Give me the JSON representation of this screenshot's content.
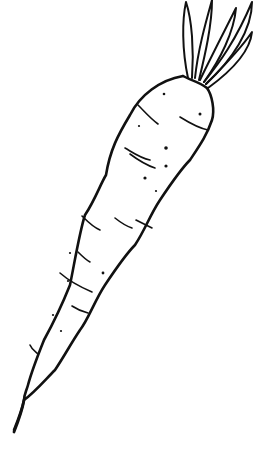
{
  "image": {
    "subject": "carrot line drawing",
    "alt": "Black-and-white outline sketch of a carrot with leafy top, drawn diagonally",
    "background_color": "#ffffff",
    "stroke_color": "#111111"
  }
}
